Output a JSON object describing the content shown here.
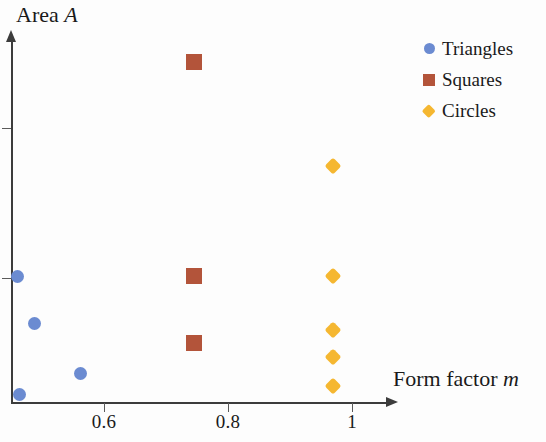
{
  "chart_data": {
    "type": "scatter",
    "title": "Area A",
    "title_parts": {
      "text": "Area ",
      "variable": "A"
    },
    "xlabel": "Form factor m",
    "xlabel_parts": {
      "text": "Form factor ",
      "variable": "m"
    },
    "ylabel": "Area A",
    "grid": false,
    "legend_position": "top-right",
    "xlim": [
      0.49,
      1.09
    ],
    "ylim": [
      0,
      1.0
    ],
    "xticks": [
      0.6,
      0.8,
      1
    ],
    "xtick_labels": [
      "0.6",
      "0.8",
      "1"
    ],
    "yticks": [
      0.75,
      0.35
    ],
    "ytick_labels": [
      "",
      ""
    ],
    "series": [
      {
        "name": "Triangles",
        "marker": "circle",
        "color": "#6b8bd1",
        "points": [
          {
            "x": 0.5,
            "y": 0.347
          },
          {
            "x": 0.527,
            "y": 0.218
          },
          {
            "x": 0.6,
            "y": 0.08
          },
          {
            "x": 0.503,
            "y": 0.022
          }
        ]
      },
      {
        "name": "Squares",
        "marker": "square",
        "color": "#b3543a",
        "points": [
          {
            "x": 0.78,
            "y": 0.938
          },
          {
            "x": 0.78,
            "y": 0.347
          },
          {
            "x": 0.78,
            "y": 0.164
          }
        ]
      },
      {
        "name": "Circles",
        "marker": "diamond",
        "color": "#f5b731",
        "points": [
          {
            "x": 1.0,
            "y": 0.652
          },
          {
            "x": 1.0,
            "y": 0.347
          },
          {
            "x": 1.0,
            "y": 0.2
          },
          {
            "x": 1.0,
            "y": 0.123
          },
          {
            "x": 1.0,
            "y": 0.043
          }
        ]
      }
    ]
  },
  "legend": {
    "entries": [
      {
        "label": "Triangles",
        "marker": "circle",
        "color": "#6b8bd1"
      },
      {
        "label": "Squares",
        "marker": "square",
        "color": "#b3543a"
      },
      {
        "label": "Circles",
        "marker": "diamond",
        "color": "#f5b731"
      }
    ]
  },
  "axes": {
    "axis_color": "#3c3c3c",
    "tick_color": "#5a5a5a"
  },
  "geometry": {
    "x_axis_y_px": 402,
    "y_axis_x_px": 11,
    "x_tick_px": [
      104,
      228,
      352
    ],
    "y_tick_px": [
      128,
      278
    ],
    "plot_left_px": 11,
    "plot_right_px": 390,
    "plot_top_px": 40,
    "plot_bottom_px": 402
  }
}
